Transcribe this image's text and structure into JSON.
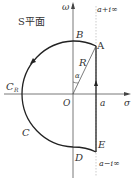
{
  "diagram": {
    "plane_label": "S平面",
    "axis_y_label": "ω",
    "axis_x_label": "σ",
    "origin_label": "O",
    "points": {
      "A": "A",
      "B": "B",
      "C": "C",
      "CR": "C",
      "CR_sub": "R",
      "D": "D",
      "E": "E"
    },
    "radius_label": "R",
    "angle_label": "α",
    "a_label": "a",
    "top_line_label": "a+i∞",
    "bottom_line_label": "a−i∞",
    "colors": {
      "stroke": "#222222",
      "dotted": "#999999",
      "text": "#333333"
    }
  }
}
